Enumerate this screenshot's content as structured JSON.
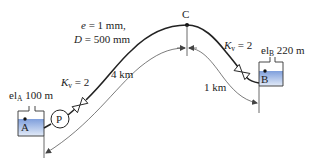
{
  "diagram": {
    "type": "pipeline-system",
    "pipe": {
      "roughness_label_var": "e",
      "roughness_label_val": "= 1 mm,",
      "diameter_label_var": "D",
      "diameter_label_val": "= 500 mm"
    },
    "reservoir_a": {
      "node_label": "A",
      "elevation_prefix": "el",
      "elevation_sub": "A",
      "elevation_value": "100 m"
    },
    "reservoir_b": {
      "node_label": "B",
      "elevation_prefix": "el",
      "elevation_sub": "B",
      "elevation_value": "220 m"
    },
    "high_point": {
      "node_label": "C"
    },
    "pump": {
      "label": "P"
    },
    "valves": [
      {
        "k_var": "K",
        "k_sub": "v",
        "k_val": "= 2"
      },
      {
        "k_var": "K",
        "k_sub": "v",
        "k_val": "= 2"
      }
    ],
    "distances": [
      {
        "label": "4 km"
      },
      {
        "label": "1 km"
      }
    ],
    "colors": {
      "water_top": "#8aa8e0",
      "water_bottom": "#dbe6f7",
      "line": "#222222",
      "dimension_line": "#444444"
    }
  }
}
